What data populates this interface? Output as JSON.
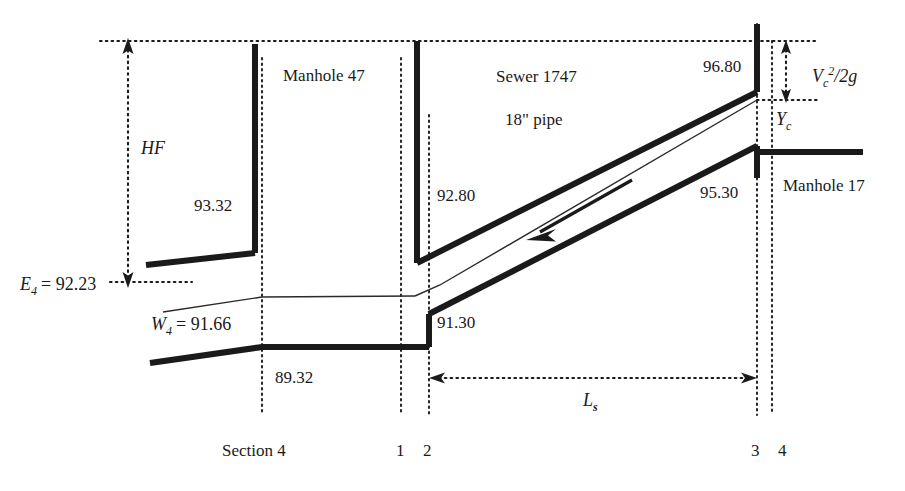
{
  "figure": {
    "type": "engineering-profile-diagram",
    "title_visible": false
  },
  "labels": {
    "manhole_left": "Manhole 47",
    "manhole_right": "Manhole 17",
    "sewer_name": "Sewer 1747",
    "pipe_size": "18\" pipe",
    "hf": "HF",
    "e4_label": "E",
    "e4_sub": "4",
    "e4_value": "= 92.23",
    "w4_label": "W",
    "w4_sub": "4",
    "w4_value": "= 91.66",
    "vc_label": "V",
    "vc_sub": "c",
    "vc_sup": "2",
    "vc_rest": "/2g",
    "yc_label": "Y",
    "yc_sub": "c",
    "ls_label": "L",
    "ls_sub": "s"
  },
  "elevations": {
    "left_crown": "93.32",
    "left_invert": "89.32",
    "mh47_crown_out": "92.80",
    "mh47_invert_out": "91.30",
    "mh17_crown": "96.80",
    "mh17_invert": "95.30"
  },
  "sections": {
    "section4_label": "Section 4",
    "one": "1",
    "two": "2",
    "three": "3",
    "four": "4"
  },
  "colors": {
    "ink": "#1a1a1a",
    "background": "#ffffff",
    "thin_line": "#2b2b2b"
  },
  "geometry": {
    "hgl_y": 41,
    "e4_y": 282,
    "section4_x": 262,
    "section1_x": 401,
    "section2_x": 429,
    "section3_x": 757,
    "section4r_x": 772
  }
}
